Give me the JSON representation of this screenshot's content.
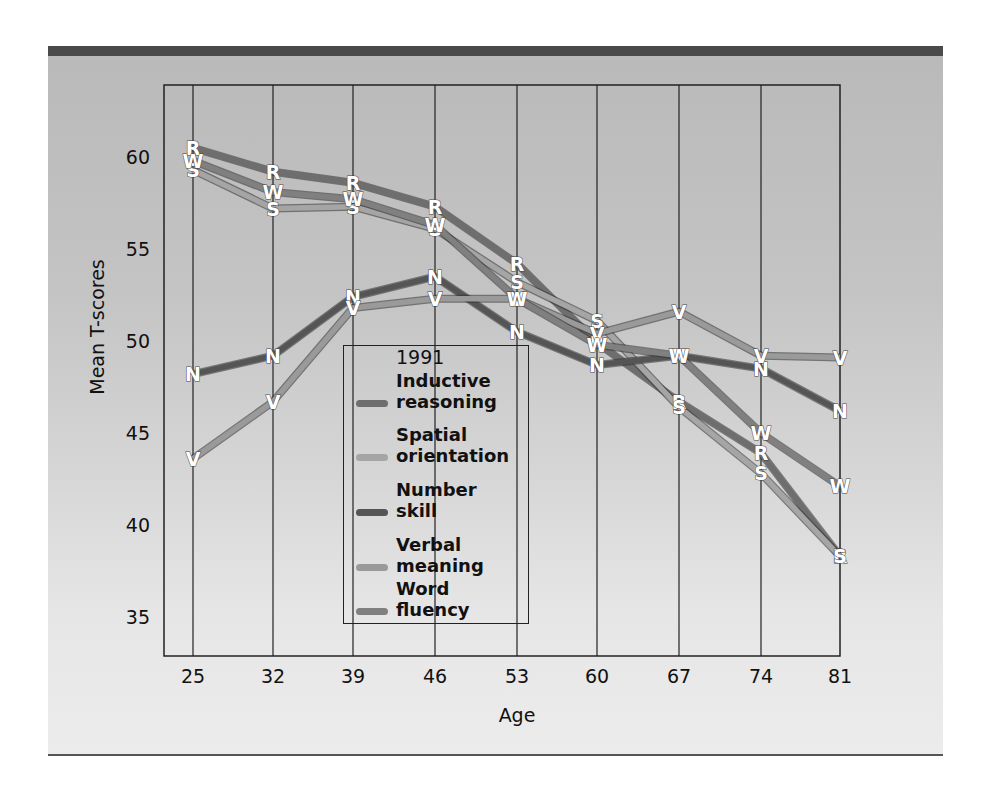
{
  "chart_data": {
    "type": "line",
    "title": "",
    "legend_title": "1991",
    "xlabel": "Age",
    "ylabel": "Mean T-scores",
    "x": [
      25,
      32,
      39,
      46,
      53,
      60,
      67,
      74,
      81
    ],
    "x_tick_labels": [
      "25",
      "32",
      "39",
      "46",
      "53",
      "60",
      "67",
      "74",
      "81"
    ],
    "y_ticks": [
      35,
      40,
      45,
      50,
      55,
      60
    ],
    "y_tick_labels": [
      "35",
      "40",
      "45",
      "50",
      "55",
      "60"
    ],
    "ylim": [
      32,
      63.5
    ],
    "grid": "vertical lines at each age",
    "legend_position": "inside, lower-center-left",
    "series": [
      {
        "name": "Inductive reasoning",
        "marker": "R",
        "color": "#6e6e6e",
        "values": [
          60.5,
          59.2,
          58.6,
          57.3,
          54.2,
          49.9,
          46.7,
          43.9,
          38.3
        ]
      },
      {
        "name": "Spatial orientation",
        "marker": "S",
        "color": "#a5a5a5",
        "values": [
          59.3,
          57.2,
          57.3,
          56.1,
          53.2,
          51.1,
          46.4,
          42.8,
          38.3
        ]
      },
      {
        "name": "Number skill",
        "marker": "N",
        "color": "#555555",
        "values": [
          48.2,
          49.2,
          52.4,
          53.5,
          50.5,
          48.7,
          49.2,
          48.5,
          46.2
        ]
      },
      {
        "name": "Verbal meaning",
        "marker": "V",
        "color": "#9a9a9a",
        "values": [
          43.6,
          46.7,
          51.8,
          52.3,
          52.3,
          50.4,
          51.6,
          49.2,
          49.1
        ]
      },
      {
        "name": "Word fluency",
        "marker": "W",
        "color": "#808080",
        "values": [
          59.8,
          58.1,
          57.7,
          56.3,
          52.3,
          49.8,
          49.2,
          45.0,
          42.1
        ]
      }
    ]
  },
  "legend": {
    "title": "1991",
    "items": [
      {
        "label": "Inductive\nreasoning",
        "color": "#6e6e6e"
      },
      {
        "label": "Spatial\norientation",
        "color": "#a5a5a5"
      },
      {
        "label": "Number\nskill",
        "color": "#555555"
      },
      {
        "label": "Verbal\nmeaning",
        "color": "#9a9a9a"
      },
      {
        "label": "Word\nfluency",
        "color": "#808080"
      }
    ]
  },
  "axes": {
    "x_title": "Age",
    "y_title": "Mean T-scores"
  }
}
